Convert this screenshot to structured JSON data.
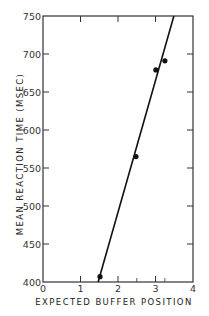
{
  "chart_data": {
    "type": "scatter",
    "title": "",
    "xlabel": "EXPECTED BUFFER POSITION",
    "ylabel": "MEAN REACTION TIME (MSEC)",
    "xlim": [
      0,
      4
    ],
    "ylim": [
      400,
      750
    ],
    "xticks": [
      0,
      1,
      2,
      3,
      4
    ],
    "yticks": [
      400,
      450,
      500,
      550,
      600,
      650,
      700,
      750
    ],
    "grid": false,
    "legend": null,
    "series": [
      {
        "name": "observed",
        "type": "scatter",
        "x": [
          1.52,
          2.48,
          3.01,
          3.25
        ],
        "y": [
          407,
          565,
          679,
          691
        ]
      },
      {
        "name": "fitted line",
        "type": "line",
        "x": [
          1.47,
          3.49
        ],
        "y": [
          400,
          750
        ]
      }
    ],
    "minor_xticks": [
      2.5,
      3.25
    ]
  },
  "colors": {
    "axis": "#333333",
    "series": "#111111",
    "background": "#ffffff"
  }
}
